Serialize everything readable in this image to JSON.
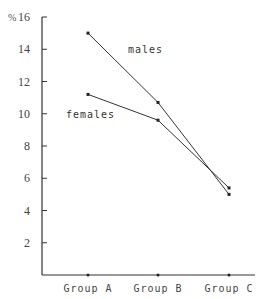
{
  "chart_data": {
    "type": "line",
    "title": "",
    "xlabel": "",
    "ylabel": "%",
    "ylim": [
      0,
      16
    ],
    "yticks": [
      2,
      4,
      6,
      8,
      10,
      12,
      14,
      16
    ],
    "categories": [
      "Group A",
      "Group B",
      "Group C"
    ],
    "series": [
      {
        "name": "males",
        "values": [
          15.0,
          10.7,
          5.0
        ]
      },
      {
        "name": "females",
        "values": [
          11.2,
          9.6,
          5.4
        ]
      }
    ],
    "grid": false,
    "legend": "inline labels"
  }
}
